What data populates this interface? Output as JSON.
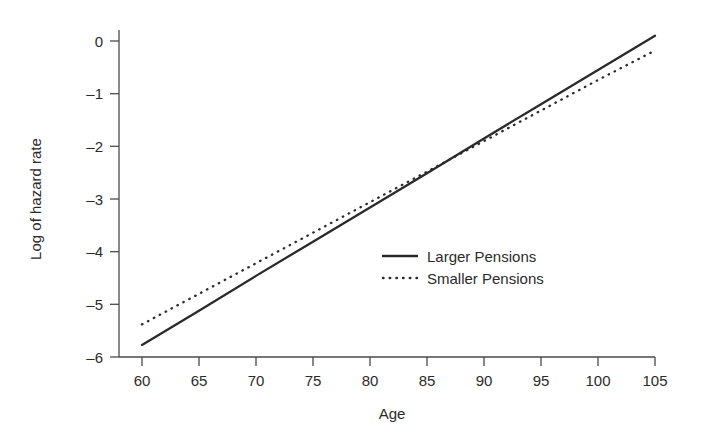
{
  "chart_data": {
    "type": "line",
    "title": "",
    "subtitle": "",
    "xlabel": "Age",
    "ylabel": "Log of hazard rate",
    "xlim": [
      58,
      106.5
    ],
    "ylim": [
      -6.25,
      0.45
    ],
    "xticks": [
      60,
      65,
      70,
      75,
      80,
      85,
      90,
      95,
      100,
      105
    ],
    "xtick_labels": [
      "60",
      "65",
      "70",
      "75",
      "80",
      "85",
      "90",
      "95",
      "100",
      "105"
    ],
    "yticks": [
      0,
      -1,
      -2,
      -3,
      -4,
      -5,
      -6
    ],
    "ytick_labels": [
      "0",
      "–1",
      "–2",
      "–3",
      "–4",
      "–5",
      "–6"
    ],
    "grid": false,
    "legend_position": "center-right",
    "x": [
      60,
      65,
      70,
      75,
      80,
      85,
      90,
      95,
      100,
      105
    ],
    "series": [
      {
        "name": "Larger Pensions",
        "style": "solid",
        "color": "#2a2a2a",
        "values": [
          -5.77,
          -5.12,
          -4.46,
          -3.81,
          -3.16,
          -2.51,
          -1.85,
          -1.2,
          -0.55,
          0.1
        ]
      },
      {
        "name": "Smaller Pensions",
        "style": "dotted",
        "color": "#2a2a2a",
        "values": [
          -5.38,
          -4.8,
          -4.22,
          -3.64,
          -3.06,
          -2.48,
          -1.9,
          -1.32,
          -0.74,
          -0.18
        ]
      }
    ],
    "annotations": []
  },
  "legend": {
    "entries": [
      {
        "label": "Larger Pensions",
        "style": "solid"
      },
      {
        "label": "Smaller Pensions",
        "style": "dotted"
      }
    ]
  },
  "axes": {
    "x_title": "Age",
    "y_title": "Log of hazard rate"
  }
}
